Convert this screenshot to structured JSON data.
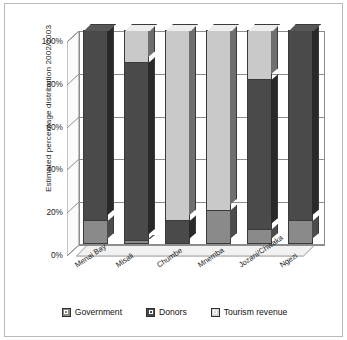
{
  "chart_data": {
    "type": "bar",
    "subtype": "stacked-column-3d",
    "title": "",
    "xlabel": "",
    "ylabel": "Estimated percentage distribution 2002/2003",
    "ylim": [
      0,
      100
    ],
    "ytick_labels": [
      "100%",
      "80%",
      "60%",
      "40%",
      "20%",
      "0%"
    ],
    "ytick_values": [
      100,
      80,
      60,
      40,
      20,
      0
    ],
    "grid": true,
    "legend_position": "bottom",
    "categories": [
      "Menai Bay",
      "Misali",
      "Chumbe",
      "Mnemba",
      "Jozani/Chwaka",
      "Ngezi"
    ],
    "series": [
      {
        "name": "Government",
        "color": "#8a8a8a",
        "values": [
          11,
          2,
          0,
          16,
          7,
          11
        ]
      },
      {
        "name": "Donors",
        "color": "#4a4a4a",
        "values": [
          89,
          83,
          11,
          0,
          70,
          89
        ]
      },
      {
        "name": "Tourism revenue",
        "color": "#c9c9c9",
        "values": [
          0,
          15,
          89,
          84,
          23,
          0
        ]
      }
    ]
  },
  "legend": {
    "items": [
      {
        "label": "Government",
        "color": "#8a8a8a"
      },
      {
        "label": "Donors",
        "color": "#4a4a4a"
      },
      {
        "label": "Tourism revenue",
        "color": "#d6d6d6"
      }
    ]
  },
  "axis": {
    "y_title": "Estimated percentage distribution 2002/2003",
    "ticks": [
      "100%",
      "80%",
      "60%",
      "40%",
      "20%",
      "0%"
    ]
  },
  "x_labels": [
    "Menai Bay",
    "Misali",
    "Chumbe",
    "Mnemba",
    "Jozani/Chwaka",
    "Ngezi"
  ]
}
